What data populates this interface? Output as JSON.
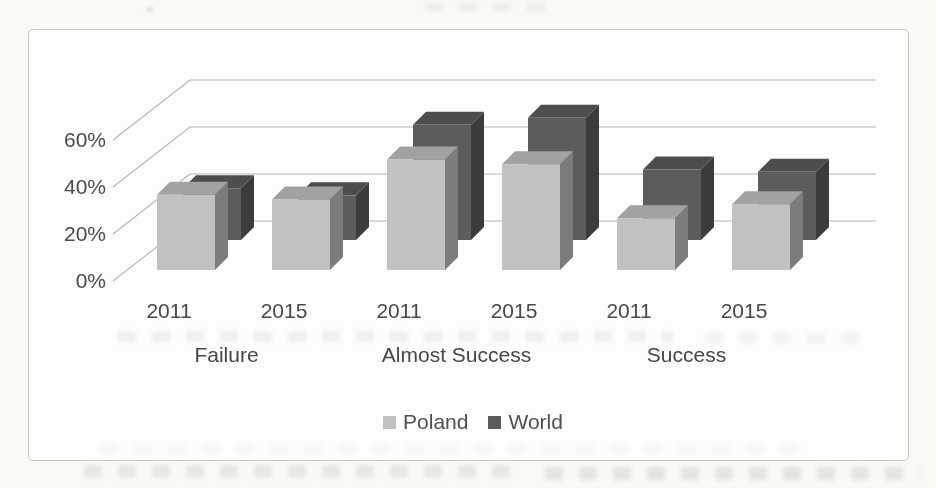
{
  "figure": {
    "kind": "scanned-3d-column-chart",
    "border_color": "#c5c5c5",
    "background": "#fdfdfb"
  },
  "chart_data": {
    "type": "bar",
    "subtype": "3d-clustered-column",
    "title": "",
    "groups": [
      "Failure",
      "Almost Success",
      "Success"
    ],
    "categories": [
      "2011",
      "2015",
      "2011",
      "2015",
      "2011",
      "2015"
    ],
    "series": [
      {
        "name": "Poland",
        "color": "#c1c1c1",
        "values": [
          32,
          30,
          47,
          45,
          22,
          28
        ]
      },
      {
        "name": "World",
        "color": "#5c5c5c",
        "values": [
          22,
          19,
          49,
          52,
          30,
          29
        ]
      }
    ],
    "y_axis": {
      "tick_labels": [
        "0%",
        "20%",
        "40%",
        "60%"
      ],
      "tick_values": [
        0,
        20,
        40,
        60
      ],
      "unit": "%",
      "range": [
        0,
        60
      ]
    },
    "legend": {
      "position": "bottom",
      "entries": [
        "Poland",
        "World"
      ]
    },
    "gridlines": true
  }
}
